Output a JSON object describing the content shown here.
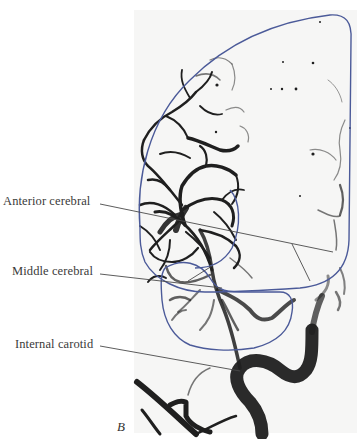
{
  "figure": {
    "panel_letter": "B",
    "labels": [
      {
        "id": "anterior",
        "text": "Anterior cerebral"
      },
      {
        "id": "middle",
        "text": "Middle cerebral"
      },
      {
        "id": "carotid",
        "text": "Internal carotid"
      }
    ],
    "outline_color": "#4a5a9a",
    "leader_color": "#444444",
    "vessel_color": "#1c1c1c"
  }
}
